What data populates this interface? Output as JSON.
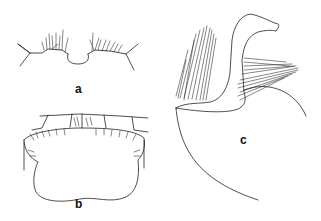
{
  "figure": {
    "type": "morphological line drawing",
    "panels": [
      {
        "id": "a",
        "label": "a",
        "description": "labrum / anterior margin with setae and median notch"
      },
      {
        "id": "b",
        "label": "b",
        "description": "plate with fringed margins and segmented upper border"
      },
      {
        "id": "c",
        "label": "c",
        "description": "lateral view of appendage with dense setal tufts and hooked process"
      }
    ],
    "colors": {
      "line": "#222222",
      "background": "#ffffff"
    }
  }
}
